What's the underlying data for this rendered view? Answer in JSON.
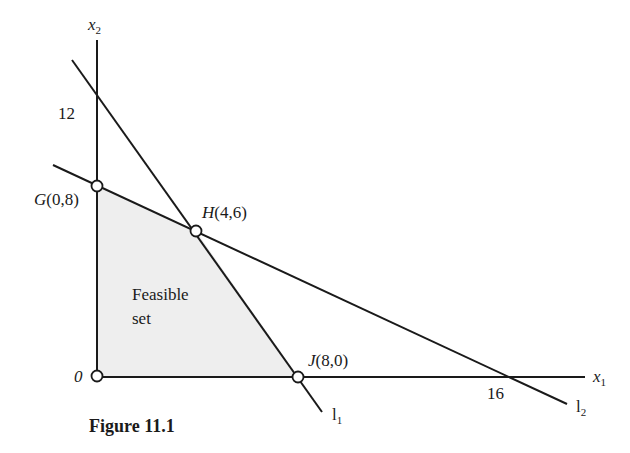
{
  "figure": {
    "caption": "Figure 11.1",
    "axes": {
      "x_label": "x",
      "x_sub": "1",
      "y_label": "x",
      "y_sub": "2",
      "origin_label": "0",
      "y_tick": "12",
      "x_tick": "16"
    },
    "points": {
      "G": {
        "name": "G",
        "coords": "(0,8)"
      },
      "H": {
        "name": "H",
        "coords": "(4,6)"
      },
      "J": {
        "name": "J",
        "coords": "(8,0)"
      }
    },
    "lines": {
      "l1": {
        "label": "l",
        "sub": "1"
      },
      "l2": {
        "label": "l",
        "sub": "2"
      }
    },
    "region": {
      "line1": "Feasible",
      "line2": "set"
    },
    "colors": {
      "stroke": "#1a1a1a",
      "fill": "#eeeeee"
    }
  }
}
